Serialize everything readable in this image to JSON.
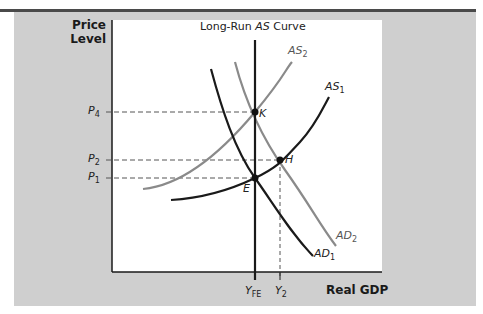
{
  "diagram": {
    "title_prefix": "Long-Run ",
    "title_italic": "AS",
    "title_suffix": " Curve",
    "y_axis_label_line1": "Price",
    "y_axis_label_line2": "Level",
    "x_axis_label": "Real GDP",
    "price_levels": [
      {
        "base": "P",
        "sub": "4"
      },
      {
        "base": "P",
        "sub": "2"
      },
      {
        "base": "P",
        "sub": "1"
      }
    ],
    "output_levels": [
      {
        "base": "Y",
        "sub": "FE"
      },
      {
        "base": "Y",
        "sub": "2"
      }
    ],
    "curves": [
      {
        "base": "AS",
        "sub": "2",
        "color": "#8a8a8a"
      },
      {
        "base": "AS",
        "sub": "1",
        "color": "#1a1a1a"
      },
      {
        "base": "AD",
        "sub": "2",
        "color": "#8a8a8a"
      },
      {
        "base": "AD",
        "sub": "1",
        "color": "#1a1a1a"
      }
    ],
    "points": [
      "K",
      "H",
      "E"
    ],
    "colors": {
      "panel": "#cfcfcf",
      "topline": "#4a4a4a",
      "dark_curve": "#1a1a1a",
      "light_curve": "#8a8a8a"
    }
  }
}
